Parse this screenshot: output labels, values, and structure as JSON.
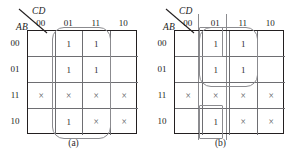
{
  "figure": {
    "type": "karnaugh-map-pair",
    "axis_labels": {
      "columns": "CD",
      "rows": "AB"
    },
    "column_headers": [
      "00",
      "01",
      "11",
      "10"
    ],
    "row_headers": [
      "00",
      "01",
      "11",
      "10"
    ],
    "symbols": {
      "one": "1",
      "dont_care": "×",
      "empty": ""
    },
    "colors": {
      "grid_outer": "#231f20",
      "grid_inner": "#6e6e72",
      "group_outline": "#8b8b8f",
      "text": "#2a2a2c",
      "background": "#ffffff"
    }
  },
  "maps": [
    {
      "id": "a",
      "caption": "(a)",
      "cells": [
        [
          "",
          "1",
          "1",
          ""
        ],
        [
          "",
          "1",
          "1",
          ""
        ],
        [
          "×",
          "×",
          "×",
          "×"
        ],
        [
          "",
          "1",
          "×",
          "×"
        ]
      ],
      "groups": [
        {
          "name": "group-columns-01-11",
          "shape": "pill",
          "covers_columns": [
            "01",
            "11"
          ],
          "covers_rows": [
            "00",
            "01",
            "11",
            "10"
          ]
        }
      ]
    },
    {
      "id": "b",
      "caption": "(b)",
      "cells": [
        [
          "",
          "1",
          "1",
          ""
        ],
        [
          "",
          "1",
          "1",
          ""
        ],
        [
          "×",
          "×",
          "×",
          "×"
        ],
        [
          "",
          "1",
          "×",
          "×"
        ]
      ],
      "groups": [
        {
          "name": "group-quad-rows-00-01",
          "shape": "pill",
          "covers_columns": [
            "01",
            "11"
          ],
          "covers_rows": [
            "00",
            "01"
          ]
        },
        {
          "name": "group-cell-00-01",
          "shape": "rect",
          "covers_columns": [
            "01"
          ],
          "covers_rows": [
            "00"
          ]
        },
        {
          "name": "group-cell-10-01",
          "shape": "rect",
          "covers_columns": [
            "01"
          ],
          "covers_rows": [
            "10"
          ]
        },
        {
          "name": "group-column-wrap-01",
          "shape": "vertical-wrap-lines",
          "covers_columns": [
            "01"
          ]
        }
      ]
    }
  ]
}
